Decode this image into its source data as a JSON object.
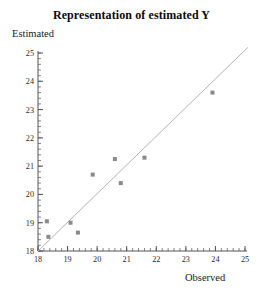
{
  "chart_data": {
    "type": "scatter",
    "title": "Representation of estimated Y",
    "xlabel": "Observed",
    "ylabel": "Estimated",
    "xlim": [
      18,
      25
    ],
    "ylim": [
      18,
      25
    ],
    "xticks": [
      18,
      19,
      20,
      21,
      22,
      23,
      24,
      25
    ],
    "yticks": [
      18,
      19,
      20,
      21,
      22,
      23,
      24,
      25
    ],
    "minor_tick_interval": 0.2,
    "grid": false,
    "legend": null,
    "series": [
      {
        "name": "observed vs estimated",
        "marker": "square",
        "marker_color": "#8a8a8a",
        "points": [
          {
            "x": 18.3,
            "y": 19.05
          },
          {
            "x": 18.35,
            "y": 18.5
          },
          {
            "x": 19.1,
            "y": 19.0
          },
          {
            "x": 19.35,
            "y": 18.65
          },
          {
            "x": 19.85,
            "y": 20.7
          },
          {
            "x": 20.6,
            "y": 21.25
          },
          {
            "x": 20.8,
            "y": 20.4
          },
          {
            "x": 21.6,
            "y": 21.3
          },
          {
            "x": 23.9,
            "y": 23.6
          }
        ]
      },
      {
        "name": "reference line",
        "type": "line",
        "line_color": "#b4b4b4",
        "x_start": 18.0,
        "y_start": 18.0,
        "x_end": 25.1,
        "y_end": 25.2
      }
    ]
  },
  "axis_colors": {
    "axis_line": "#555555",
    "tick_label": "#2a2a2a",
    "marker": "#8a8a8a",
    "reference_line": "#b4b4b4"
  }
}
